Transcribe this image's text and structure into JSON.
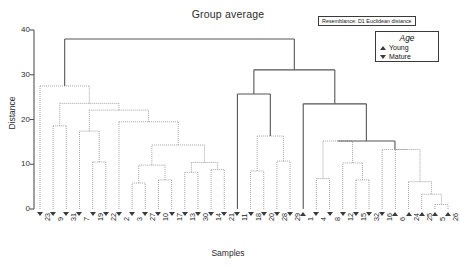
{
  "chart_data": {
    "type": "dendrogram",
    "title": "Group average",
    "xlabel": "Samples",
    "ylabel": "Distance",
    "ylim": [
      0,
      40
    ],
    "yticks": [
      0,
      10,
      20,
      30,
      40
    ],
    "grid": false,
    "resemblance": "Resemblance: D1 Euclidean distance",
    "legend": {
      "title": "Age",
      "position": "top-right",
      "entries": [
        {
          "marker": "triangle-up",
          "label": "Young"
        },
        {
          "marker": "triangle-down",
          "label": "Mature"
        }
      ]
    },
    "leaves": [
      {
        "label": "23",
        "age": "Mature"
      },
      {
        "label": "9",
        "age": "Mature"
      },
      {
        "label": "31",
        "age": "Mature"
      },
      {
        "label": "7",
        "age": "Mature"
      },
      {
        "label": "19",
        "age": "Mature"
      },
      {
        "label": "22",
        "age": "Mature"
      },
      {
        "label": "2",
        "age": "Mature"
      },
      {
        "label": "3",
        "age": "Mature"
      },
      {
        "label": "27",
        "age": "Mature"
      },
      {
        "label": "10",
        "age": "Mature"
      },
      {
        "label": "17",
        "age": "Mature"
      },
      {
        "label": "13",
        "age": "Mature"
      },
      {
        "label": "30",
        "age": "Mature"
      },
      {
        "label": "14",
        "age": "Mature"
      },
      {
        "label": "21",
        "age": "Mature"
      },
      {
        "label": "11",
        "age": "Mature"
      },
      {
        "label": "18",
        "age": "Mature"
      },
      {
        "label": "20",
        "age": "Mature"
      },
      {
        "label": "28",
        "age": "Mature"
      },
      {
        "label": "29",
        "age": "Mature"
      },
      {
        "label": "1",
        "age": "Young"
      },
      {
        "label": "4",
        "age": "Mature"
      },
      {
        "label": "8",
        "age": "Mature"
      },
      {
        "label": "12",
        "age": "Mature"
      },
      {
        "label": "15",
        "age": "Mature"
      },
      {
        "label": "32",
        "age": "Mature"
      },
      {
        "label": "16",
        "age": "Mature"
      },
      {
        "label": "6",
        "age": "Young"
      },
      {
        "label": "24",
        "age": "Young"
      },
      {
        "label": "25",
        "age": "Young"
      },
      {
        "label": "5",
        "age": "Young"
      },
      {
        "label": "26",
        "age": "Young"
      }
    ],
    "merges": [
      {
        "id": "m1",
        "left": "9",
        "right": "31",
        "height": 18.6,
        "style": "dotted"
      },
      {
        "id": "m2",
        "left": "19",
        "right": "22",
        "height": 10.5,
        "style": "dotted"
      },
      {
        "id": "m3",
        "left": "7",
        "right": "m2",
        "height": 17.4,
        "style": "dotted"
      },
      {
        "id": "m4",
        "left": "3",
        "right": "27",
        "height": 5.8,
        "style": "dotted"
      },
      {
        "id": "m5",
        "left": "10",
        "right": "17",
        "height": 6.5,
        "style": "dotted"
      },
      {
        "id": "m6",
        "left": "m4",
        "right": "m5",
        "height": 9.8,
        "style": "dotted"
      },
      {
        "id": "m7",
        "left": "13",
        "right": "30",
        "height": 8.2,
        "style": "dotted"
      },
      {
        "id": "m8",
        "left": "14",
        "right": "21",
        "height": 8.8,
        "style": "dotted"
      },
      {
        "id": "m9",
        "left": "m7",
        "right": "m8",
        "height": 10.4,
        "style": "dotted"
      },
      {
        "id": "m10",
        "left": "m6",
        "right": "m9",
        "height": 14.3,
        "style": "dotted"
      },
      {
        "id": "m11",
        "left": "2",
        "right": "m10",
        "height": 19.5,
        "style": "dotted"
      },
      {
        "id": "m12",
        "left": "m3",
        "right": "m11",
        "height": 22.1,
        "style": "dotted"
      },
      {
        "id": "m13",
        "left": "m1",
        "right": "m12",
        "height": 23.6,
        "style": "dotted"
      },
      {
        "id": "m14",
        "left": "23",
        "right": "m13",
        "height": 27.5,
        "style": "dotted"
      },
      {
        "id": "m15",
        "left": "18",
        "right": "20",
        "height": 8.5,
        "style": "dotted"
      },
      {
        "id": "m16",
        "left": "28",
        "right": "29",
        "height": 10.7,
        "style": "dotted"
      },
      {
        "id": "m17",
        "left": "m15",
        "right": "m16",
        "height": 16.3,
        "style": "dotted"
      },
      {
        "id": "m18",
        "left": "11",
        "right": "m17",
        "height": 25.7,
        "style": "solid"
      },
      {
        "id": "m19",
        "left": "4",
        "right": "8",
        "height": 6.8,
        "style": "dotted"
      },
      {
        "id": "m20",
        "left": "15",
        "right": "32",
        "height": 6.5,
        "style": "dotted"
      },
      {
        "id": "m21",
        "left": "12",
        "right": "m20",
        "height": 10.3,
        "style": "dotted"
      },
      {
        "id": "m22",
        "left": "m19",
        "right": "m21",
        "height": 15.2,
        "style": "dotted"
      },
      {
        "id": "m23",
        "left": "5",
        "right": "26",
        "height": 1.0,
        "style": "dotted"
      },
      {
        "id": "m24",
        "left": "25",
        "right": "m23",
        "height": 3.3,
        "style": "dotted"
      },
      {
        "id": "m25",
        "left": "24",
        "right": "m24",
        "height": 6.1,
        "style": "dotted"
      },
      {
        "id": "m26",
        "left": "6",
        "right": "m25",
        "height": 13.3,
        "style": "dotted"
      },
      {
        "id": "m27",
        "left": "16",
        "right": "m26",
        "height": 13.3,
        "style": "dotted"
      },
      {
        "id": "m28",
        "left": "m22",
        "right": "m27",
        "height": 15.2,
        "style": "solid"
      },
      {
        "id": "m29",
        "left": "1",
        "right": "m28",
        "height": 23.5,
        "style": "solid"
      },
      {
        "id": "m30",
        "left": "m18",
        "right": "m29",
        "height": 31.1,
        "style": "solid"
      },
      {
        "id": "m31",
        "left": "m14",
        "right": "m30",
        "height": 38.0,
        "style": "solid"
      }
    ]
  }
}
